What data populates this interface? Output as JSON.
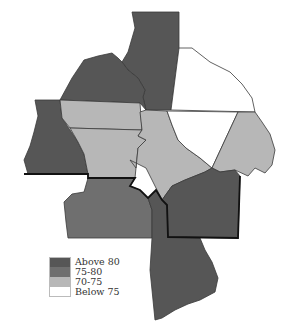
{
  "map": {
    "type": "choropleth",
    "colors": {
      "above_80": "#565656",
      "75_80": "#6f6f6f",
      "70_75": "#b7b7b7",
      "below_75": "#ffffff"
    },
    "regions": [
      {
        "id": "north-center-tall",
        "category": "Above 80"
      },
      {
        "id": "northwest",
        "category": "Above 80"
      },
      {
        "id": "northeast",
        "category": "Below 75"
      },
      {
        "id": "west",
        "category": "Above 80"
      },
      {
        "id": "center-west-upper",
        "category": "70-75"
      },
      {
        "id": "center-west-lower",
        "category": "70-75"
      },
      {
        "id": "center",
        "category": "70-75"
      },
      {
        "id": "center-east",
        "category": "Below 75"
      },
      {
        "id": "east",
        "category": "70-75"
      },
      {
        "id": "southeast",
        "category": "Above 80"
      },
      {
        "id": "southwest",
        "category": "75-80"
      },
      {
        "id": "south",
        "category": "Above 80"
      }
    ]
  },
  "legend": {
    "items": [
      {
        "label": "Above 80",
        "color": "#565656"
      },
      {
        "label": "75-80",
        "color": "#6f6f6f"
      },
      {
        "label": "70-75",
        "color": "#b7b7b7"
      },
      {
        "label": "Below 75",
        "color": "#ffffff"
      }
    ]
  }
}
